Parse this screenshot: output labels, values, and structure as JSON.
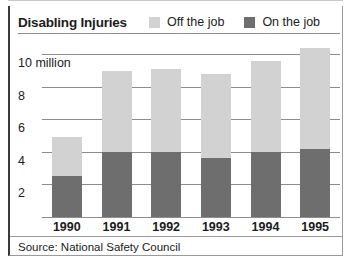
{
  "chart_data": {
    "type": "bar",
    "stacked": true,
    "title": "Disabling Injuries",
    "xlabel": "",
    "ylabel": "",
    "ylim": [
      0,
      11
    ],
    "yticks": [
      2,
      4,
      6,
      8,
      10
    ],
    "ytick_labels": [
      "2",
      "4",
      "6",
      "8",
      "10 million"
    ],
    "grid": true,
    "legend_position": "top-right",
    "categories": [
      "1990",
      "1991",
      "1992",
      "1993",
      "1994",
      "1995"
    ],
    "series": [
      {
        "name": "On the job",
        "color": "#6e6e6e",
        "values": [
          2.5,
          4.0,
          4.0,
          3.6,
          4.0,
          4.2
        ]
      },
      {
        "name": "Off the job",
        "color": "#d2d2d2",
        "values": [
          2.4,
          5.0,
          5.1,
          5.2,
          5.6,
          6.2
        ]
      }
    ],
    "totals": [
      4.9,
      9.0,
      9.1,
      8.8,
      9.6,
      10.4
    ],
    "units": "millions of injuries",
    "source": "Source: National Safety Council"
  },
  "header": {
    "title": "Disabling Injuries",
    "legend": [
      {
        "label": "Off the job",
        "color": "#d2d2d2"
      },
      {
        "label": "On the job",
        "color": "#6e6e6e"
      }
    ]
  },
  "axis": {
    "y_labels": [
      "10 million",
      "8",
      "6",
      "4",
      "2"
    ],
    "x_labels": [
      "1990",
      "1991",
      "1992",
      "1993",
      "1994",
      "1995"
    ]
  },
  "footer": {
    "source": "Source: National Safety Council"
  }
}
